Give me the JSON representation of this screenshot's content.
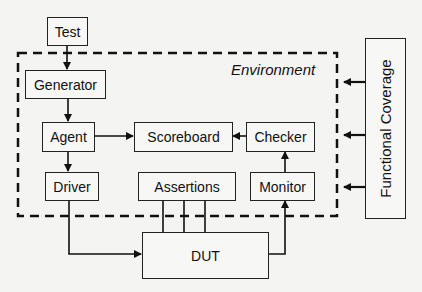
{
  "diagram": {
    "environment_label": "Environment",
    "blocks": {
      "test": "Test",
      "generator": "Generator",
      "agent": "Agent",
      "scoreboard": "Scoreboard",
      "checker": "Checker",
      "driver": "Driver",
      "assertions": "Assertions",
      "monitor": "Monitor",
      "dut": "DUT",
      "functional_coverage": "Functional Coverage"
    },
    "edges": [
      {
        "from": "Test",
        "to": "Generator"
      },
      {
        "from": "Generator",
        "to": "Agent"
      },
      {
        "from": "Agent",
        "to": "Scoreboard"
      },
      {
        "from": "Agent",
        "to": "Driver"
      },
      {
        "from": "Checker",
        "to": "Scoreboard"
      },
      {
        "from": "Monitor",
        "to": "Checker"
      },
      {
        "from": "Driver",
        "to": "DUT"
      },
      {
        "from": "Assertions",
        "to": "DUT",
        "count": 3
      },
      {
        "from": "DUT",
        "to": "Monitor"
      },
      {
        "from": "Functional Coverage",
        "to": "Environment",
        "count": 3
      }
    ]
  }
}
